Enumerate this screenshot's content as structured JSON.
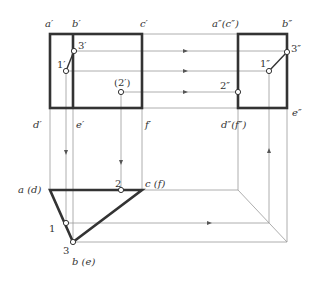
{
  "figure": {
    "front_view": {
      "labels": {
        "a": "a′",
        "b": "b′",
        "c": "c′",
        "d": "d′",
        "e": "e′",
        "f": "f′",
        "p1": "1′",
        "p2": "(2′)",
        "p3": "3′"
      }
    },
    "side_view": {
      "labels": {
        "ac": "a″(c″)",
        "b": "b″",
        "df": "d″(f″)",
        "e": "e″",
        "p1": "1″",
        "p2": "2″",
        "p3": "3″"
      }
    },
    "top_view": {
      "labels": {
        "ad": "a (d)",
        "be": "b (e)",
        "cf": "c (f)",
        "p1": "1",
        "p2": "2",
        "p3": "3"
      }
    },
    "colors": {
      "outline": "#333333",
      "construction": "#999999",
      "background": "#ffffff"
    }
  }
}
